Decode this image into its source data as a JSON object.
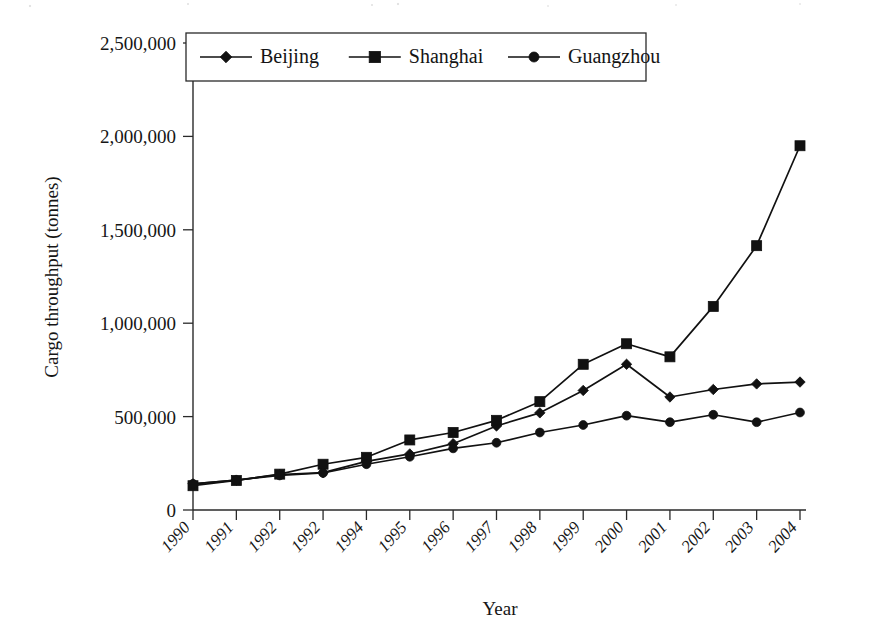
{
  "figure": {
    "background_color": "#ffffff",
    "ink_color": "#111111"
  },
  "chart_data": {
    "type": "line",
    "title": "",
    "xlabel": "Year",
    "ylabel": "Cargo throughput (tonnes)",
    "categories": [
      "1990",
      "1991",
      "1992",
      "1992",
      "1994",
      "1995",
      "1996",
      "1997",
      "1998",
      "1999",
      "2000",
      "2001",
      "2002",
      "2003",
      "2004"
    ],
    "x_tick_labels": [
      "1990",
      "1991",
      "1992",
      "1992",
      "1994",
      "1995",
      "1996",
      "1997",
      "1998",
      "1999",
      "2000",
      "2001",
      "2002",
      "2003",
      "2004"
    ],
    "y_tick_labels": [
      "0",
      "500,000",
      "1,000,000",
      "1,500,000",
      "2,000,000",
      "2,500,000"
    ],
    "y_tick_values": [
      0,
      500000,
      1000000,
      1500000,
      2000000,
      2500000
    ],
    "ylim": [
      0,
      2500000
    ],
    "grid": false,
    "legend_position": "top-left-inside",
    "series": [
      {
        "name": "Beijing",
        "marker": "diamond",
        "values": [
          140000,
          160000,
          190000,
          200000,
          260000,
          300000,
          355000,
          450000,
          520000,
          640000,
          780000,
          605000,
          645000,
          675000,
          685000
        ]
      },
      {
        "name": "Shanghai",
        "marker": "square",
        "values": [
          130000,
          158000,
          192000,
          245000,
          282000,
          375000,
          415000,
          480000,
          580000,
          780000,
          890000,
          820000,
          1090000,
          1415000,
          1950000
        ]
      },
      {
        "name": "Guangzhou",
        "marker": "circle",
        "values": [
          140000,
          160000,
          185000,
          198000,
          245000,
          285000,
          330000,
          360000,
          415000,
          455000,
          505000,
          470000,
          510000,
          470000,
          522000
        ]
      }
    ]
  },
  "legend": {
    "entries": [
      {
        "label": "Beijing",
        "marker": "diamond"
      },
      {
        "label": "Shanghai",
        "marker": "square"
      },
      {
        "label": "Guangzhou",
        "marker": "circle"
      }
    ]
  }
}
